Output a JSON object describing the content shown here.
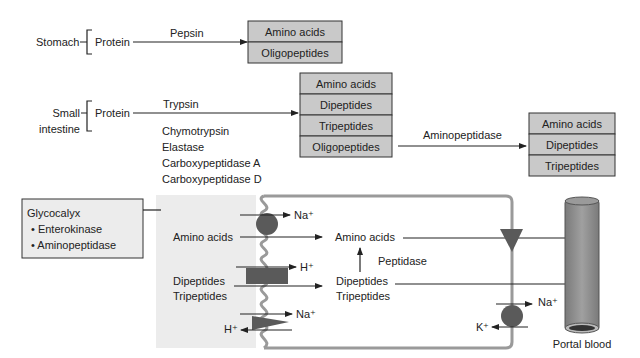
{
  "stomach": {
    "label": "Stomach",
    "substrate": "Protein",
    "enzyme": "Pepsin",
    "products": [
      "Amino acids",
      "Oligopeptides"
    ]
  },
  "small_intestine": {
    "label_line1": "Small",
    "label_line2": "intestine",
    "substrate": "Protein",
    "enzymes": [
      "Trypsin",
      "Chymotrypsin",
      "Elastase",
      "Carboxypeptidase A",
      "Carboxypeptidase D"
    ],
    "products": [
      "Amino acids",
      "Dipeptides",
      "Tripeptides",
      "Oligopeptides"
    ],
    "second_enzyme": "Aminopeptidase",
    "second_products": [
      "Amino acids",
      "Dipeptides",
      "Tripeptides"
    ]
  },
  "glycocalyx": {
    "title": "Glycocalyx",
    "items": [
      "• Enterokinase",
      "• Aminopeptidase"
    ]
  },
  "enterocyte": {
    "lumen_amino": "Amino acids",
    "lumen_di": "Dipeptides",
    "lumen_tri": "Tripeptides",
    "na1": "Na⁺",
    "h1": "H⁺",
    "na2": "Na⁺",
    "h2": "H⁺",
    "cell_amino": "Amino acids",
    "peptidase": "Peptidase",
    "cell_di": "Dipeptides",
    "cell_tri": "Tripeptides",
    "na3": "Na⁺",
    "k1": "K⁺"
  },
  "portal": {
    "label": "Portal blood"
  },
  "colors": {
    "box": "#c9c9c9",
    "lumen": "#ececec",
    "transporter": "#5a5a5a",
    "membrane": "#9a9a9a",
    "vessel": "#8c8c8c"
  }
}
